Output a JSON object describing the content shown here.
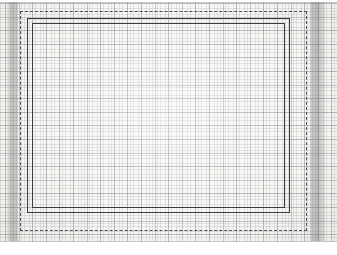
{
  "document": {
    "kind": "graph-paper-scan",
    "description": "Scanned sheet of fine-ruled graph paper with hand-drawn nested rectangles",
    "canvas": {
      "width": 337,
      "height": 255
    },
    "background_color": "#ffffff"
  },
  "paper": {
    "name": "graph-paper-sheet",
    "color": "#f7f7f4",
    "top": 2,
    "height": 240,
    "edge_line_color": "#aaaaa8"
  },
  "grid": {
    "name": "graph-grid",
    "minor_spacing_px": 2.72,
    "major_spacing_px": 13.6,
    "minor_color": "#8c929b",
    "major_color": "#787c84",
    "minor_opacity": 0.22,
    "major_opacity": 0.4,
    "origin_offset": {
      "x": 5,
      "y": 1
    }
  },
  "scan_bands": [
    {
      "name": "scan-shadow-left",
      "side": "left",
      "x": 7,
      "width": 11,
      "color": "#78766f"
    },
    {
      "name": "scan-shadow-right",
      "side": "right",
      "x": 310,
      "width": 15,
      "color": "#78766f"
    }
  ],
  "shapes": [
    {
      "name": "dashed-rectangle",
      "style": "dashed",
      "color": "#4c4f56",
      "stroke_px": 1,
      "x": 20,
      "y": 11,
      "width": 287,
      "height": 220
    },
    {
      "name": "solid-rectangle-outer",
      "style": "solid",
      "color": "#3a3c42",
      "stroke_px": 1.3,
      "x": 27,
      "y": 18,
      "width": 263,
      "height": 195
    },
    {
      "name": "solid-rectangle-inner",
      "style": "solid",
      "color": "#3a3c42",
      "stroke_px": 1.3,
      "x": 32,
      "y": 23,
      "width": 253,
      "height": 185
    }
  ]
}
